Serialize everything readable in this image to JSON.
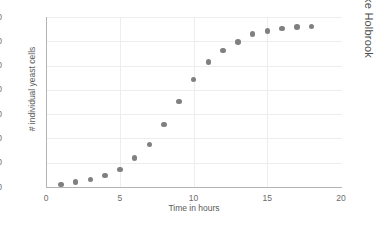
{
  "chart_data": {
    "type": "scatter",
    "title": "",
    "xlabel": "Time in hours",
    "ylabel": "# individual yeast cells",
    "xlim": [
      0,
      20
    ],
    "ylim": [
      0,
      700
    ],
    "xticks": [
      0,
      5,
      10,
      15,
      20
    ],
    "yticks": [
      0,
      100,
      200,
      300,
      400,
      500,
      600,
      700
    ],
    "grid": true,
    "legend": false,
    "marker_color": "#808080",
    "x": [
      1,
      2,
      3,
      4,
      5,
      6,
      7,
      8,
      9,
      10,
      11,
      12,
      13,
      14,
      15,
      16,
      17,
      18
    ],
    "values": [
      10,
      20,
      30,
      48,
      72,
      120,
      175,
      258,
      352,
      443,
      515,
      562,
      597,
      630,
      643,
      652,
      658,
      661
    ],
    "series": [
      {
        "name": "# individual yeast cells",
        "values": [
          10,
          20,
          30,
          48,
          72,
          120,
          175,
          258,
          352,
          443,
          515,
          562,
          597,
          630,
          643,
          652,
          658,
          661
        ]
      }
    ]
  },
  "watermark": {
    "text": "© Luke Holbrook"
  },
  "colors": {
    "marker": "#808080",
    "grid": "#ededed",
    "axis": "#b3b3b3",
    "text": "#5a5a5a",
    "background": "#ffffff"
  }
}
